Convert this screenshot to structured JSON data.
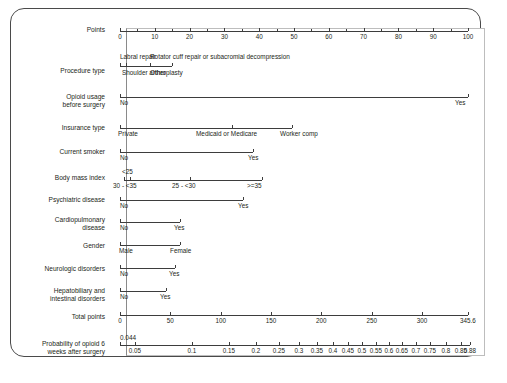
{
  "figure": {
    "type": "nomogram",
    "axis_left_px": 120,
    "axis_right_px": 468
  },
  "rows": [
    {
      "id": "points",
      "label": "Points",
      "kind": "scale",
      "axis": {
        "x0": 120,
        "x1": 468,
        "min": 0,
        "max": 100
      },
      "ticks_major": [
        0,
        10,
        20,
        30,
        40,
        50,
        60,
        70,
        80,
        90,
        100
      ],
      "ticks_minor": [
        5,
        15,
        25,
        35,
        45,
        55,
        65,
        75,
        85,
        95
      ],
      "tick_labels": [
        "0",
        "10",
        "20",
        "30",
        "40",
        "50",
        "60",
        "70",
        "80",
        "90",
        "100"
      ]
    },
    {
      "id": "procedure-type",
      "label": "Procedure type",
      "kind": "categorical",
      "axis": {
        "x0": 120,
        "x1": 172
      },
      "points_min": 0,
      "points_max": 15,
      "categories_above": [
        {
          "label": "Labral repair",
          "x": 120,
          "align": "left"
        },
        {
          "label": "Rotator cuff repair or subacromial decompression",
          "x": 150,
          "align": "left"
        }
      ],
      "categories_below": [
        {
          "label": "Shoulder\narthroplasty",
          "x": 122,
          "align": "left"
        },
        {
          "label": "Other",
          "x": 150,
          "align": "left"
        }
      ],
      "tick_positions": [
        120,
        126,
        150,
        172
      ]
    },
    {
      "id": "opioid-usage-before-surgery",
      "label": "Opioid usage\nbefore surgery",
      "kind": "binary",
      "axis": {
        "x0": 120,
        "x1": 468
      },
      "values": [
        {
          "label": "No",
          "x": 120
        },
        {
          "label": "Yes",
          "x": 468
        }
      ]
    },
    {
      "id": "insurance-type",
      "label": "Insurance type",
      "kind": "categorical",
      "axis": {
        "x0": 120,
        "x1": 292
      },
      "values": [
        {
          "label": "Private",
          "x": 120
        },
        {
          "label": "Medicaid or Medicare",
          "x": 232
        },
        {
          "label": "Worker comp",
          "x": 292
        }
      ]
    },
    {
      "id": "current-smoker",
      "label": "Current smoker",
      "kind": "binary",
      "axis": {
        "x0": 120,
        "x1": 253
      },
      "values": [
        {
          "label": "No",
          "x": 120
        },
        {
          "label": "Yes",
          "x": 253
        }
      ]
    },
    {
      "id": "body-mass-index",
      "label": "Body mass index",
      "kind": "categorical",
      "axis": {
        "x0": 124,
        "x1": 262
      },
      "labels_above": [
        {
          "label": "<25",
          "x": 127
        }
      ],
      "labels_below": [
        {
          "label": "30 - <35",
          "x": 117,
          "align": "left"
        },
        {
          "label": "25 - <30",
          "x": 175,
          "align": "left"
        },
        {
          "label": ">=35",
          "x": 250,
          "align": "left"
        }
      ],
      "tick_positions": [
        124,
        130,
        190,
        262
      ]
    },
    {
      "id": "psychiatric-disease",
      "label": "Psychiatric disease",
      "kind": "binary",
      "axis": {
        "x0": 120,
        "x1": 243
      },
      "values": [
        {
          "label": "No",
          "x": 120
        },
        {
          "label": "Yes",
          "x": 243
        }
      ]
    },
    {
      "id": "cardiopulmonary-disease",
      "label": "Cardiopulmonary\ndisease",
      "kind": "binary",
      "axis": {
        "x0": 120,
        "x1": 180
      },
      "values": [
        {
          "label": "No",
          "x": 120
        },
        {
          "label": "Yes",
          "x": 180
        }
      ]
    },
    {
      "id": "gender",
      "label": "Gender",
      "kind": "binary",
      "axis": {
        "x0": 120,
        "x1": 180
      },
      "values": [
        {
          "label": "Male",
          "x": 120
        },
        {
          "label": "Female",
          "x": 180
        }
      ]
    },
    {
      "id": "neurologic-disorders",
      "label": "Neurologic disorders",
      "kind": "binary",
      "axis": {
        "x0": 120,
        "x1": 175
      },
      "values": [
        {
          "label": "No",
          "x": 120
        },
        {
          "label": "Yes",
          "x": 175
        }
      ]
    },
    {
      "id": "hepatobiliary-and-intestinal-disorders",
      "label": "Hepatobiliary and\nintestinal disorders",
      "kind": "binary",
      "axis": {
        "x0": 120,
        "x1": 166
      },
      "values": [
        {
          "label": "No",
          "x": 120
        },
        {
          "label": "Yes",
          "x": 166
        }
      ]
    },
    {
      "id": "total-points",
      "label": "Total points",
      "kind": "scale",
      "axis": {
        "x0": 120,
        "x1": 468,
        "min": 0,
        "max": 345.6
      },
      "ticks_major": [
        0,
        50,
        100,
        150,
        200,
        250,
        300,
        345.6
      ],
      "tick_labels": [
        "0",
        "50",
        "100",
        "150",
        "200",
        "250",
        "300",
        "345.6"
      ]
    },
    {
      "id": "probability-of-opioid-6-weeks-after-surgery",
      "label": "Probability of opioid 6\nweeks after surgery",
      "kind": "scale-nonlinear",
      "axis": {
        "x0": 120,
        "x1": 468
      },
      "label_above": {
        "text": "0.044",
        "x": 122,
        "align": "left"
      },
      "ticks": [
        {
          "label": "0.05",
          "x": 135
        },
        {
          "label": "0.1",
          "x": 192
        },
        {
          "label": "0.15",
          "x": 229
        },
        {
          "label": "0.2",
          "x": 256
        },
        {
          "label": "0.25",
          "x": 279
        },
        {
          "label": "0.3",
          "x": 299
        },
        {
          "label": "0.35",
          "x": 317
        },
        {
          "label": "0.4",
          "x": 333
        },
        {
          "label": "0.45",
          "x": 348
        },
        {
          "label": "0.5",
          "x": 362
        },
        {
          "label": "0.55",
          "x": 376
        },
        {
          "label": "0.6",
          "x": 389
        },
        {
          "label": "0.65",
          "x": 402
        },
        {
          "label": "0.7",
          "x": 416
        },
        {
          "label": "0.75",
          "x": 430
        },
        {
          "label": "0.8",
          "x": 446
        },
        {
          "label": "0.85",
          "x": 461
        },
        {
          "label": "0.88",
          "x": 470
        }
      ]
    }
  ],
  "chart_data": {
    "type": "table",
    "xlabel": "Points",
    "ylabel": "",
    "predictors": [
      {
        "name": "Procedure type",
        "levels": [
          "Labral repair",
          "Shoulder arthroplasty",
          "Other",
          "Rotator cuff repair or subacromial decompression"
        ]
      },
      {
        "name": "Opioid usage before surgery",
        "levels": [
          "No",
          "Yes"
        ]
      },
      {
        "name": "Insurance type",
        "levels": [
          "Private",
          "Medicaid or Medicare",
          "Worker comp"
        ]
      },
      {
        "name": "Current smoker",
        "levels": [
          "No",
          "Yes"
        ]
      },
      {
        "name": "Body mass index",
        "levels": [
          "<25",
          "30 - <35",
          "25 - <30",
          ">=35"
        ]
      },
      {
        "name": "Psychiatric disease",
        "levels": [
          "No",
          "Yes"
        ]
      },
      {
        "name": "Cardiopulmonary disease",
        "levels": [
          "No",
          "Yes"
        ]
      },
      {
        "name": "Gender",
        "levels": [
          "Male",
          "Female"
        ]
      },
      {
        "name": "Neurologic disorders",
        "levels": [
          "No",
          "Yes"
        ]
      },
      {
        "name": "Hepatobiliary and intestinal disorders",
        "levels": [
          "No",
          "Yes"
        ]
      }
    ],
    "points_axis": {
      "min": 0,
      "max": 100,
      "ticks": [
        0,
        10,
        20,
        30,
        40,
        50,
        60,
        70,
        80,
        90,
        100
      ]
    },
    "total_points_axis": {
      "min": 0,
      "max": 345.6,
      "ticks": [
        0,
        50,
        100,
        150,
        200,
        250,
        300,
        345.6
      ]
    },
    "probability_axis": {
      "min": 0.044,
      "max": 0.88,
      "ticks": [
        0.05,
        0.1,
        0.15,
        0.2,
        0.25,
        0.3,
        0.35,
        0.4,
        0.45,
        0.5,
        0.55,
        0.6,
        0.65,
        0.7,
        0.75,
        0.8,
        0.85,
        0.88
      ]
    }
  }
}
